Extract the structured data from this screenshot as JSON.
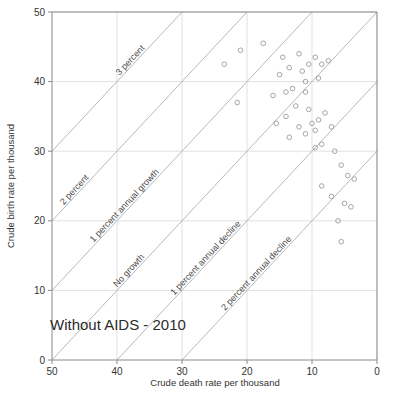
{
  "chart_data": {
    "type": "scatter",
    "title": "Without AIDS - 2010",
    "xlabel": "Crude death rate per thousand",
    "ylabel": "Crude birth rate per thousand",
    "xlim": [
      50,
      0
    ],
    "ylim": [
      0,
      50
    ],
    "x_reversed": true,
    "xticks": [
      50,
      40,
      30,
      20,
      10,
      0
    ],
    "yticks": [
      0,
      10,
      20,
      30,
      40,
      50
    ],
    "xtick_labels": [
      "50",
      "40",
      "30",
      "20",
      "10",
      "0"
    ],
    "ytick_labels": [
      "0",
      "10",
      "20",
      "30",
      "40",
      "50"
    ],
    "grid": true,
    "legend": "none",
    "marker": "open-circle",
    "marker_color": "#9a9aa5",
    "reference_lines": [
      {
        "label": "No growth",
        "growth_percent": 0,
        "intercept": 50
      },
      {
        "label": "1 percent annual growth",
        "growth_percent": 1,
        "intercept": 60
      },
      {
        "label": "2 percent",
        "growth_percent": 2,
        "intercept": 70
      },
      {
        "label": "3 percent",
        "growth_percent": 3,
        "intercept": 80
      },
      {
        "label": "1 percent annual decline",
        "growth_percent": -1,
        "intercept": 40
      },
      {
        "label": "2 percent annual decline",
        "growth_percent": -2,
        "intercept": 30
      }
    ],
    "points": [
      {
        "death": 21.0,
        "birth": 44.5
      },
      {
        "death": 23.5,
        "birth": 42.5
      },
      {
        "death": 17.5,
        "birth": 45.5
      },
      {
        "death": 14.5,
        "birth": 43.5
      },
      {
        "death": 13.5,
        "birth": 42.0
      },
      {
        "death": 15.0,
        "birth": 41.0
      },
      {
        "death": 12.0,
        "birth": 44.0
      },
      {
        "death": 11.5,
        "birth": 41.5
      },
      {
        "death": 11.0,
        "birth": 40.0
      },
      {
        "death": 9.5,
        "birth": 43.5
      },
      {
        "death": 8.5,
        "birth": 42.5
      },
      {
        "death": 7.5,
        "birth": 43.0
      },
      {
        "death": 10.5,
        "birth": 42.5
      },
      {
        "death": 13.0,
        "birth": 39.0
      },
      {
        "death": 14.0,
        "birth": 38.5
      },
      {
        "death": 16.0,
        "birth": 38.0
      },
      {
        "death": 11.0,
        "birth": 38.5
      },
      {
        "death": 9.0,
        "birth": 40.5
      },
      {
        "death": 21.5,
        "birth": 37.0
      },
      {
        "death": 12.5,
        "birth": 36.5
      },
      {
        "death": 10.5,
        "birth": 36.0
      },
      {
        "death": 14.0,
        "birth": 35.0
      },
      {
        "death": 15.5,
        "birth": 34.0
      },
      {
        "death": 12.0,
        "birth": 33.5
      },
      {
        "death": 10.0,
        "birth": 34.0
      },
      {
        "death": 9.5,
        "birth": 33.0
      },
      {
        "death": 9.0,
        "birth": 34.5
      },
      {
        "death": 11.0,
        "birth": 32.5
      },
      {
        "death": 13.5,
        "birth": 32.0
      },
      {
        "death": 8.0,
        "birth": 35.5
      },
      {
        "death": 7.0,
        "birth": 33.5
      },
      {
        "death": 8.5,
        "birth": 31.0
      },
      {
        "death": 9.5,
        "birth": 30.5
      },
      {
        "death": 6.5,
        "birth": 30.0
      },
      {
        "death": 5.5,
        "birth": 28.0
      },
      {
        "death": 4.5,
        "birth": 26.5
      },
      {
        "death": 3.5,
        "birth": 26.0
      },
      {
        "death": 8.5,
        "birth": 25.0
      },
      {
        "death": 7.0,
        "birth": 23.5
      },
      {
        "death": 5.0,
        "birth": 22.5
      },
      {
        "death": 4.0,
        "birth": 22.0
      },
      {
        "death": 6.0,
        "birth": 20.0
      },
      {
        "death": 5.5,
        "birth": 17.0
      }
    ]
  }
}
